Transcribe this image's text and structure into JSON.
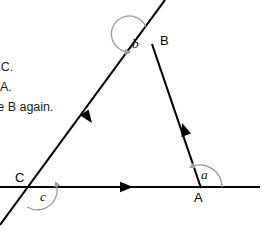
{
  "figure": {
    "type": "geometry-diagram",
    "colors": {
      "line": "#000000",
      "arc": "#9a9a9a",
      "text": "#1a1a1a",
      "background": "#ffffff"
    },
    "points": {
      "A": {
        "x": 200,
        "y": 186
      },
      "B": {
        "x": 152,
        "y": 44
      },
      "C": {
        "x": 38,
        "y": 187
      }
    },
    "lines": [
      {
        "name": "horizontal-base-line",
        "x1": 0,
        "y1": 187,
        "x2": 260,
        "y2": 187
      },
      {
        "name": "line-through-C-and-B",
        "x1": 0,
        "y1": 225,
        "x2": 165,
        "y2": 0
      },
      {
        "name": "line-through-B-and-A",
        "x1": 152,
        "y1": 44,
        "x2": 200,
        "y2": 186
      }
    ],
    "direction_arrows": [
      {
        "name": "arrow-on-side-CB",
        "x": 98,
        "y": 117,
        "angle": 243
      },
      {
        "name": "arrow-on-side-BA",
        "x": 180,
        "y": 118,
        "angle": 71
      },
      {
        "name": "arrow-on-base-CA",
        "x": 123,
        "y": 187,
        "angle": 0
      }
    ],
    "vertex_labels": [
      {
        "name": "vertex-label-a",
        "text": "A",
        "x": 196,
        "y": 192
      },
      {
        "name": "vertex-label-b",
        "text": "B",
        "x": 160,
        "y": 34
      },
      {
        "name": "vertex-label-c",
        "text": "C",
        "x": 17,
        "y": 172
      }
    ],
    "angle_labels": [
      {
        "name": "angle-label-a",
        "text": "a",
        "x": 202,
        "y": 170
      },
      {
        "name": "angle-label-b",
        "text": "b",
        "x": 133,
        "y": 37
      },
      {
        "name": "angle-label-c",
        "text": "c",
        "x": 41,
        "y": 190
      }
    ]
  },
  "instructions": {
    "lines": [
      {
        "text": "ce C."
      },
      {
        "text": "ce A."
      },
      {
        "text": "ace B again."
      }
    ]
  }
}
